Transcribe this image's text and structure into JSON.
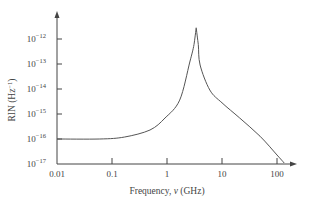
{
  "chart_data": {
    "type": "line",
    "title": "",
    "xlabel": "Frequency, ν (GHz)",
    "xlabel_parts": {
      "prefix": "Frequency, ",
      "var": "v",
      "suffix": " (GHz)"
    },
    "ylabel": "RIN (Hz⁻¹)",
    "ylabel_parts": {
      "prefix": "RIN (Hz",
      "sup": "−1",
      "suffix": ")"
    },
    "x_scale": "log",
    "y_scale": "log",
    "xlim": [
      0.01,
      150
    ],
    "ylim": [
      1e-17,
      1e-11
    ],
    "x_ticks": [
      {
        "value": 0.01,
        "label": "0.01"
      },
      {
        "value": 0.1,
        "label": "0.1"
      },
      {
        "value": 1,
        "label": "1"
      },
      {
        "value": 10,
        "label": "10"
      },
      {
        "value": 100,
        "label": "100"
      }
    ],
    "y_ticks": [
      {
        "value": 1e-17,
        "base": "10",
        "exp": "−17"
      },
      {
        "value": 1e-16,
        "base": "10",
        "exp": "−16"
      },
      {
        "value": 1e-15,
        "base": "10",
        "exp": "−15"
      },
      {
        "value": 1e-14,
        "base": "10",
        "exp": "−14"
      },
      {
        "value": 1e-13,
        "base": "10",
        "exp": "−13"
      },
      {
        "value": 1e-12,
        "base": "10",
        "exp": "−12"
      }
    ],
    "grid": false,
    "legend": null,
    "series": [
      {
        "name": "RIN",
        "x": [
          0.01,
          0.06,
          0.17,
          0.49,
          0.92,
          1.7,
          2.6,
          3.1,
          3.4,
          3.7,
          4.0,
          6.0,
          10,
          21,
          49,
          100,
          135
        ],
        "y": [
          1e-16,
          1e-16,
          1.2e-16,
          2.3e-16,
          6.9e-16,
          3.6e-15,
          1.2e-13,
          6e-13,
          2.8e-12,
          6e-13,
          9.1e-14,
          9.1e-15,
          2.8e-15,
          6.9e-16,
          1.3e-16,
          2.3e-17,
          1.1e-17
        ]
      }
    ],
    "annotations": [
      {
        "text": "resonance peak",
        "x": 3.4,
        "y": 2.8e-12
      }
    ]
  },
  "colors": {
    "axis": "#444444",
    "curve": "#555555",
    "text": "#444444"
  }
}
